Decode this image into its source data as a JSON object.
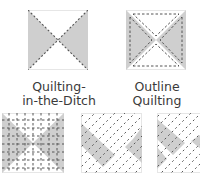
{
  "diagrams": [
    {
      "id": "quilting-in-the-ditch",
      "label_line1": "Quilting-",
      "label_line2": "in-the-Ditch",
      "shaded": "left-right-triangles",
      "stitching": "diagonals-along-seams"
    },
    {
      "id": "outline-quilting",
      "label_line1": "Outline",
      "label_line2": "Quilting",
      "shaded": "left-right-triangles",
      "stitching": "offset-outline-of-each-triangle"
    },
    {
      "id": "grid-quilting",
      "shaded": "left-right-triangles",
      "stitching": "horizontal-and-vertical-grid"
    },
    {
      "id": "diagonal-line-quilting",
      "shaded": "left-right-triangles-rotated",
      "stitching": "parallel-diagonal-lines"
    },
    {
      "id": "diagonal-line-quilting-cropped",
      "shaded": "left-right-triangles-rotated",
      "stitching": "parallel-diagonal-lines"
    }
  ],
  "colors": {
    "shade": "#cfcfcf",
    "stitch": "#555555",
    "border": "#e6e6e6",
    "text": "#3a3a3a"
  }
}
